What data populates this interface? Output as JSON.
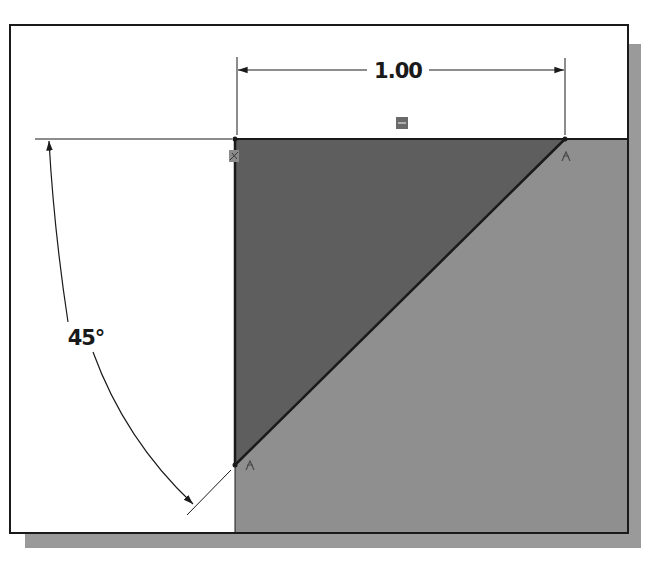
{
  "diagram": {
    "type": "sketch-with-dimensions",
    "linear_dimension": {
      "label": "1.00",
      "value": 1.0
    },
    "angular_dimension": {
      "label": "45°",
      "value": 45
    },
    "constraint_icons": [
      {
        "name": "fixed-origin-constraint",
        "position": "top-left vertex"
      },
      {
        "name": "horizontal-constraint",
        "position": "top edge midpoint"
      },
      {
        "name": "coincident-constraint",
        "position": "top-right vertex"
      },
      {
        "name": "coincident-constraint",
        "position": "bottom-left vertex"
      }
    ],
    "colors": {
      "background": "#ffffff",
      "frame_border": "#1a1a1a",
      "shadow": "#9a9a9a",
      "region_light": "#8f8f8f",
      "triangle_dark": "#5e5e5e",
      "line": "#1a1a1a",
      "icon": "#6a6a6a"
    }
  }
}
